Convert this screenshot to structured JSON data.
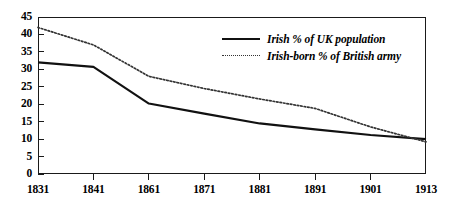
{
  "chart_data": {
    "type": "line",
    "title": "",
    "subtitle": "",
    "xlabel": "",
    "ylabel": "",
    "categories": [
      "1831",
      "1841",
      "1861",
      "1871",
      "1881",
      "1891",
      "1901",
      "1913"
    ],
    "xtick_labels": [
      "1831",
      "1841",
      "1861",
      "1871",
      "1881",
      "1891",
      "1901",
      "1913"
    ],
    "ytick_labels": [
      "0",
      "5",
      "10",
      "15",
      "20",
      "25",
      "30",
      "35",
      "40",
      "45"
    ],
    "ytick_values": [
      0,
      5,
      10,
      15,
      20,
      25,
      30,
      35,
      40,
      45
    ],
    "ylim": [
      0,
      45
    ],
    "grid": false,
    "legend_position": "inside-upper-right",
    "series": [
      {
        "name": "Irish % of UK population",
        "style": "solid",
        "color": "#111111",
        "values": [
          32.0,
          30.7,
          20.2,
          17.3,
          14.5,
          12.8,
          11.2,
          10.0
        ]
      },
      {
        "name": "Irish-born % of British army",
        "style": "dotted",
        "color": "#333333",
        "values": [
          42.0,
          37.0,
          28.0,
          24.5,
          21.5,
          18.8,
          13.5,
          9.2
        ]
      }
    ]
  },
  "legend": {
    "items": [
      {
        "label": "Irish % of UK population",
        "style": "solid"
      },
      {
        "label": "Irish-born % of British army",
        "style": "dotted"
      }
    ]
  },
  "axes": {
    "frame_color": "#1a1a1a"
  }
}
